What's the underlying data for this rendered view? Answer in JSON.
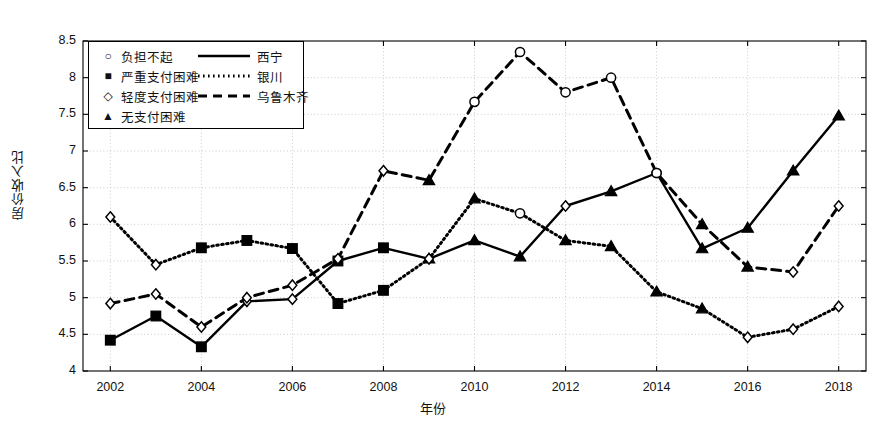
{
  "chart_data": {
    "type": "line",
    "title": "",
    "xlabel": "年份",
    "ylabel": "房价收入比",
    "x": [
      2002,
      2003,
      2004,
      2005,
      2006,
      2007,
      2008,
      2009,
      2010,
      2011,
      2012,
      2013,
      2014,
      2015,
      2016,
      2017,
      2018
    ],
    "xtick_labels": [
      "2002",
      "2004",
      "2006",
      "2008",
      "2010",
      "2012",
      "2014",
      "2016",
      "2018"
    ],
    "xticks": [
      2002,
      2004,
      2006,
      2008,
      2010,
      2012,
      2014,
      2016,
      2018
    ],
    "yticks": [
      4,
      4.5,
      5,
      5.5,
      6,
      6.5,
      7,
      7.5,
      8,
      8.5
    ],
    "ytick_labels": [
      "4",
      "4.5",
      "5",
      "5.5",
      "6",
      "6.5",
      "7",
      "7.5",
      "8",
      "8.5"
    ],
    "xlim": [
      2001.4,
      2018.6
    ],
    "ylim": [
      4,
      8.5
    ],
    "grid": true,
    "legend_position": "upper-left",
    "series": [
      {
        "name": "西宁",
        "line_style": "solid",
        "values": [
          4.42,
          4.75,
          4.33,
          4.95,
          4.98,
          5.5,
          5.68,
          5.53,
          5.78,
          5.56,
          6.25,
          6.45,
          6.7,
          5.67,
          5.95,
          6.73,
          7.48
        ],
        "markers": [
          "square",
          "square",
          "square",
          "diamond",
          "diamond",
          "square",
          "square",
          "triangle",
          "triangle",
          "triangle",
          "diamond",
          "triangle",
          "circle",
          "triangle",
          "triangle",
          "triangle",
          "triangle"
        ]
      },
      {
        "name": "银川",
        "line_style": "dotted",
        "values": [
          6.1,
          5.45,
          5.68,
          5.78,
          5.67,
          4.92,
          5.1,
          5.53,
          6.35,
          6.15,
          5.78,
          5.7,
          5.08,
          4.85,
          4.46,
          4.57,
          4.88
        ],
        "markers": [
          "diamond",
          "diamond",
          "square",
          "square",
          "square",
          "square",
          "square",
          "diamond",
          "triangle",
          "circle",
          "triangle",
          "triangle",
          "triangle",
          "triangle",
          "diamond",
          "diamond",
          "diamond"
        ]
      },
      {
        "name": "乌鲁木齐",
        "line_style": "dashed",
        "values": [
          4.92,
          5.05,
          4.6,
          5.0,
          5.17,
          5.53,
          6.73,
          6.6,
          7.67,
          8.35,
          7.8,
          8.0,
          6.7,
          6.0,
          5.42,
          5.35,
          6.25
        ],
        "markers": [
          "diamond",
          "diamond",
          "diamond",
          "diamond",
          "diamond",
          "diamond",
          "diamond",
          "triangle",
          "circle",
          "circle",
          "circle",
          "circle",
          "circle",
          "triangle",
          "triangle",
          "diamond",
          "diamond"
        ]
      }
    ],
    "marker_legend": [
      {
        "marker": "circle",
        "label": "负担不起"
      },
      {
        "marker": "square",
        "label": "严重支付困难"
      },
      {
        "marker": "diamond",
        "label": "轻度支付困难"
      },
      {
        "marker": "triangle",
        "label": "无支付困难"
      }
    ],
    "line_legend": [
      {
        "line_style": "solid",
        "label": "西宁"
      },
      {
        "line_style": "dotted",
        "label": "银川"
      },
      {
        "line_style": "dashed",
        "label": "乌鲁木齐"
      }
    ],
    "colors": {
      "series": "#000000",
      "grid": "#bfbfbf",
      "axis": "#000000",
      "background": "#ffffff"
    }
  }
}
